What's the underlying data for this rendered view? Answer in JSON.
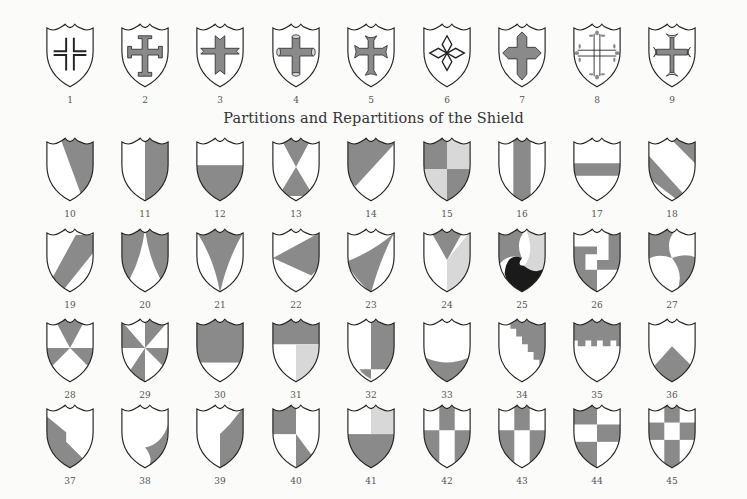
{
  "title": "Partitions and Repartitions of the Shield",
  "colors": {
    "paper": "#fbfbfa",
    "ink": "#222222",
    "shade": "#8a8a8a",
    "light": "#d8d8d8",
    "black": "#1a1a1a",
    "white": "#ffffff"
  },
  "shields": [
    {
      "n": "1",
      "row": 0,
      "col": 0,
      "design": "cross-voided"
    },
    {
      "n": "2",
      "row": 0,
      "col": 1,
      "design": "cross-potent"
    },
    {
      "n": "3",
      "row": 0,
      "col": 2,
      "design": "cross-dovetailed-ends"
    },
    {
      "n": "4",
      "row": 0,
      "col": 3,
      "design": "cross-pommee-cylinders"
    },
    {
      "n": "5",
      "row": 0,
      "col": 4,
      "design": "cross-moline"
    },
    {
      "n": "6",
      "row": 0,
      "col": 5,
      "design": "cross-of-lozenges-voided"
    },
    {
      "n": "7",
      "row": 0,
      "col": 6,
      "design": "cross-pointed"
    },
    {
      "n": "8",
      "row": 0,
      "col": 7,
      "design": "cross-double-trefle"
    },
    {
      "n": "9",
      "row": 0,
      "col": 8,
      "design": "cross-fleury"
    },
    {
      "n": "10",
      "row": 1,
      "col": 0,
      "design": "per-bend"
    },
    {
      "n": "11",
      "row": 1,
      "col": 1,
      "design": "per-pale"
    },
    {
      "n": "12",
      "row": 1,
      "col": 2,
      "design": "per-fess"
    },
    {
      "n": "13",
      "row": 1,
      "col": 3,
      "design": "per-saltire"
    },
    {
      "n": "14",
      "row": 1,
      "col": 4,
      "design": "per-bend-sinister"
    },
    {
      "n": "15",
      "row": 1,
      "col": 5,
      "design": "quarterly"
    },
    {
      "n": "16",
      "row": 1,
      "col": 6,
      "design": "pale"
    },
    {
      "n": "17",
      "row": 1,
      "col": 7,
      "design": "fess"
    },
    {
      "n": "18",
      "row": 1,
      "col": 8,
      "design": "bend"
    },
    {
      "n": "19",
      "row": 2,
      "col": 0,
      "design": "bend-sinister"
    },
    {
      "n": "20",
      "row": 2,
      "col": 1,
      "design": "chape"
    },
    {
      "n": "21",
      "row": 2,
      "col": 2,
      "design": "pile"
    },
    {
      "n": "22",
      "row": 2,
      "col": 3,
      "design": "gyron"
    },
    {
      "n": "23",
      "row": 2,
      "col": 4,
      "design": "flanch-curved"
    },
    {
      "n": "24",
      "row": 2,
      "col": 5,
      "design": "tierced-in-pairle"
    },
    {
      "n": "25",
      "row": 2,
      "col": 6,
      "design": "gyronny-curved-three"
    },
    {
      "n": "26",
      "row": 2,
      "col": 7,
      "design": "fret-step"
    },
    {
      "n": "27",
      "row": 2,
      "col": 8,
      "design": "per-fess-wavy-curved"
    },
    {
      "n": "28",
      "row": 3,
      "col": 0,
      "design": "gyronny-of-eight-a"
    },
    {
      "n": "29",
      "row": 3,
      "col": 1,
      "design": "gyronny-of-eight-b"
    },
    {
      "n": "30",
      "row": 3,
      "col": 2,
      "design": "chief-large"
    },
    {
      "n": "31",
      "row": 3,
      "col": 3,
      "design": "chief-and-quarter"
    },
    {
      "n": "32",
      "row": 3,
      "col": 4,
      "design": "per-pale-with-base"
    },
    {
      "n": "33",
      "row": 3,
      "col": 5,
      "design": "base-curved"
    },
    {
      "n": "34",
      "row": 3,
      "col": 6,
      "design": "per-bend-embattled"
    },
    {
      "n": "35",
      "row": 3,
      "col": 7,
      "design": "chief-embattled"
    },
    {
      "n": "36",
      "row": 3,
      "col": 8,
      "design": "chevron-base"
    },
    {
      "n": "37",
      "row": 4,
      "col": 0,
      "design": "per-bend-sinister-stepped"
    },
    {
      "n": "38",
      "row": 4,
      "col": 1,
      "design": "flanch-dexter-curl"
    },
    {
      "n": "39",
      "row": 4,
      "col": 2,
      "design": "per-pale-angled"
    },
    {
      "n": "40",
      "row": 4,
      "col": 3,
      "design": "tierced-quarters"
    },
    {
      "n": "41",
      "row": 4,
      "col": 4,
      "design": "quarterly-canton"
    },
    {
      "n": "42",
      "row": 4,
      "col": 5,
      "design": "checky-six-a"
    },
    {
      "n": "43",
      "row": 4,
      "col": 6,
      "design": "checky-six-b"
    },
    {
      "n": "44",
      "row": 4,
      "col": 7,
      "design": "checky-six-c"
    },
    {
      "n": "45",
      "row": 4,
      "col": 8,
      "design": "checky-nine"
    }
  ]
}
